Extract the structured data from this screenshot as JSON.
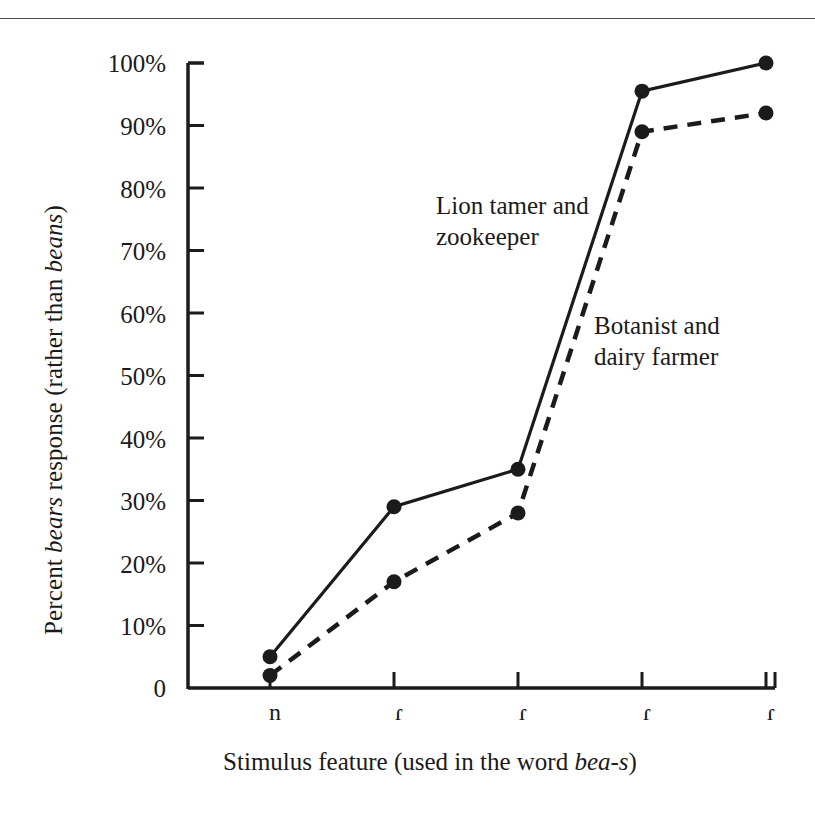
{
  "figure": {
    "top_rule": true,
    "ink_color": "#1b1b1b"
  },
  "chart_data": {
    "type": "line",
    "title": "",
    "xlabel_parts": {
      "pre": "Stimulus feature (used in the word ",
      "italic": "bea-s",
      "post": ")"
    },
    "xlabel": "Stimulus feature (used in the word bea-s)",
    "ylabel_parts": {
      "pre": "Percent ",
      "italic1": "bears",
      "mid": " response (rather than ",
      "italic2": "beans",
      "post": ")"
    },
    "ylabel": "Percent bears response (rather than beans)",
    "categories": [
      "n",
      "ɾ",
      "ɾ",
      "ɾ",
      "ɾ"
    ],
    "xtick_labels": [
      "n",
      "ɾ",
      "ɾ",
      "ɾ",
      "ɾ"
    ],
    "ytick_labels": [
      "100%",
      "90%",
      "80%",
      "70%",
      "60%",
      "50%",
      "40%",
      "30%",
      "20%",
      "10%",
      "0"
    ],
    "ytick_values": [
      100,
      90,
      80,
      70,
      60,
      50,
      40,
      30,
      20,
      10,
      0
    ],
    "ylim": [
      0,
      100
    ],
    "grid": false,
    "legend_position": "inline-annotations",
    "series": [
      {
        "name": "Lion tamer and zookeeper",
        "style": "solid",
        "label_text": "Lion tamer and\nzookeeper",
        "values": [
          5,
          29,
          35,
          95.5,
          100
        ]
      },
      {
        "name": "Botanist and dairy farmer",
        "style": "dashed",
        "label_text": "Botanist and\ndairy farmer",
        "values": [
          2,
          17,
          28,
          89,
          92
        ]
      }
    ]
  }
}
